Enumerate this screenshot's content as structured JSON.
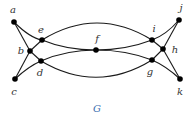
{
  "graph": {
    "name": "G",
    "name_color": "#3a6fb0",
    "vertices": [
      "a",
      "b",
      "c",
      "d",
      "e",
      "f",
      "g",
      "h",
      "i",
      "j",
      "k"
    ],
    "edges": [
      [
        "a",
        "b"
      ],
      [
        "a",
        "e"
      ],
      [
        "b",
        "e"
      ],
      [
        "b",
        "d"
      ],
      [
        "c",
        "b"
      ],
      [
        "c",
        "d"
      ],
      [
        "e",
        "f"
      ],
      [
        "d",
        "f"
      ],
      [
        "e",
        "i"
      ],
      [
        "d",
        "g"
      ],
      [
        "f",
        "i"
      ],
      [
        "f",
        "g"
      ],
      [
        "i",
        "h"
      ],
      [
        "g",
        "h"
      ],
      [
        "j",
        "h"
      ],
      [
        "j",
        "i"
      ],
      [
        "k",
        "h"
      ],
      [
        "k",
        "g"
      ]
    ]
  }
}
